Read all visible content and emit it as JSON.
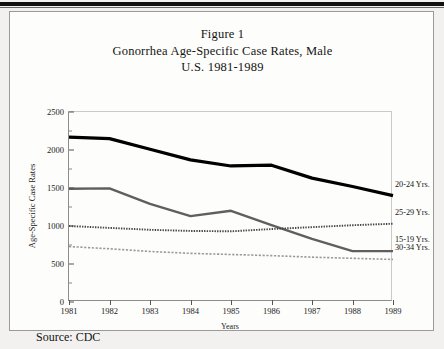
{
  "figure": {
    "title_lines": [
      "Figure 1",
      "Gonorrhea Age-Specific Case Rates, Male",
      "U.S. 1981-1989"
    ],
    "source": "Source: CDC"
  },
  "chart_data": {
    "type": "line",
    "xlabel": "Years",
    "ylabel": "Age-Specific Case Rates",
    "categories": [
      "1981",
      "1982",
      "1983",
      "1984",
      "1985",
      "1986",
      "1987",
      "1988",
      "1989"
    ],
    "x": [
      1981,
      1982,
      1983,
      1984,
      1985,
      1986,
      1987,
      1988,
      1989
    ],
    "xlim": [
      1981,
      1989
    ],
    "ylim": [
      0,
      2500
    ],
    "yticks": [
      0,
      500,
      1000,
      1500,
      2000,
      2500
    ],
    "grid": false,
    "legend_position": "right",
    "series": [
      {
        "name": "20-24 Yrs.",
        "style": "solid-thick-black",
        "color": "#000000",
        "values": [
          2170,
          2150,
          2010,
          1870,
          1790,
          1800,
          1630,
          1520,
          1400
        ]
      },
      {
        "name": "15-19 Yrs.",
        "style": "solid-gray",
        "color": "#5f5f5f",
        "values": [
          1490,
          1495,
          1290,
          1130,
          1200,
          1010,
          830,
          670,
          670
        ]
      },
      {
        "name": "25-29 Yrs.",
        "style": "dotted",
        "color": "#444444",
        "values": [
          1000,
          975,
          950,
          935,
          930,
          960,
          985,
          1010,
          1030
        ]
      },
      {
        "name": "30-34 Yrs.",
        "style": "dashed-light",
        "color": "#9a9a9a",
        "values": [
          730,
          700,
          665,
          640,
          625,
          610,
          590,
          575,
          560
        ]
      }
    ]
  },
  "axes": {
    "ytick_labels": [
      "2500",
      "2000",
      "1500",
      "1000",
      "500",
      "0"
    ],
    "xtick_labels": [
      "1981",
      "1982",
      "1983",
      "1984",
      "1985",
      "1986",
      "1987",
      "1988",
      "1989"
    ],
    "ylabel": "Age-Specific Case Rates",
    "xlabel": "Years"
  },
  "legend": [
    {
      "label": "20-24 Yrs."
    },
    {
      "label": "15-19 Yrs."
    },
    {
      "label": "25-29 Yrs."
    },
    {
      "label": "30-34 Yrs."
    }
  ]
}
